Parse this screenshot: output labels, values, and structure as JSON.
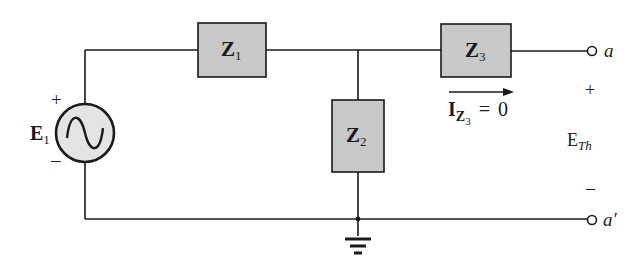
{
  "figure": {
    "type": "circuit-schematic",
    "background": "#ffffff",
    "component_fill": "#c8c8c8",
    "line_color": "#1a1a1a"
  },
  "source": {
    "name": "E",
    "subscript": "1",
    "type": "ac-voltage-source",
    "plus_label": "+",
    "minus_label": "–"
  },
  "impedances": [
    {
      "name": "Z",
      "subscript": "1",
      "position": "series-top-left"
    },
    {
      "name": "Z",
      "subscript": "2",
      "position": "shunt-middle"
    },
    {
      "name": "Z",
      "subscript": "3",
      "position": "series-top-right"
    }
  ],
  "current_annotation": {
    "symbol": "I",
    "subscript_symbol": "Z",
    "subscript_index": "3",
    "equals": "=",
    "value": "0",
    "direction": "right"
  },
  "terminals": {
    "top": {
      "label": "a"
    },
    "bottom": {
      "label": "a′"
    }
  },
  "thevenin_voltage": {
    "symbol": "E",
    "subscript": "Th",
    "plus_label": "+",
    "minus_label": "–"
  },
  "ground": {
    "present": true
  }
}
